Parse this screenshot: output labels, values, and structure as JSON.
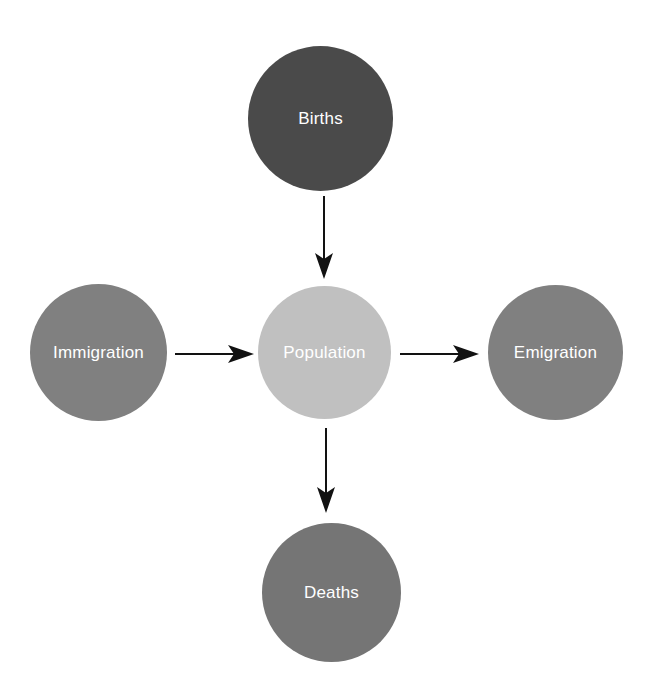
{
  "diagram": {
    "background_color": "#ffffff",
    "arrow_color": "#121212",
    "label_color": "#ffffff",
    "nodes": [
      {
        "id": "births",
        "label": "Births",
        "color": "#4a4a4a",
        "position": "top",
        "center_x": 320,
        "center_y": 118,
        "radius": 72
      },
      {
        "id": "immigration",
        "label": "Immigration",
        "color": "#808080",
        "position": "left",
        "center_x": 98,
        "center_y": 352,
        "radius": 68
      },
      {
        "id": "population",
        "label": "Population",
        "color": "#c0c0c0",
        "position": "center",
        "center_x": 324,
        "center_y": 352,
        "radius": 66
      },
      {
        "id": "emigration",
        "label": "Emigration",
        "color": "#808080",
        "position": "right",
        "center_x": 555,
        "center_y": 352,
        "radius": 67
      },
      {
        "id": "deaths",
        "label": "Deaths",
        "color": "#757575",
        "position": "bottom",
        "center_x": 331,
        "center_y": 592,
        "radius": 69
      }
    ],
    "arrows": [
      {
        "id": "births-to-population",
        "from": "births",
        "to": "population",
        "direction": "down"
      },
      {
        "id": "immigration-to-population",
        "from": "immigration",
        "to": "population",
        "direction": "right"
      },
      {
        "id": "population-to-emigration",
        "from": "population",
        "to": "emigration",
        "direction": "right"
      },
      {
        "id": "population-to-deaths",
        "from": "population",
        "to": "deaths",
        "direction": "down"
      }
    ]
  }
}
